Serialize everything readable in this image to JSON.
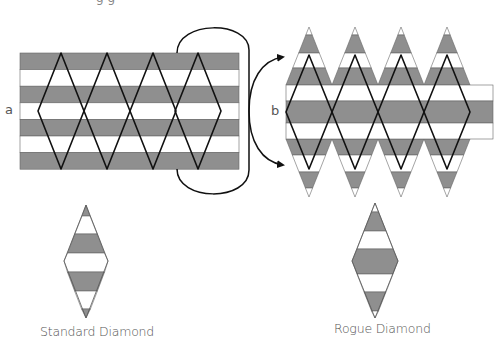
{
  "figure": {
    "top_clipped_text": "g g",
    "panel_a": {
      "label": "a"
    },
    "panel_b": {
      "label": "b"
    },
    "captions": {
      "standard": "Standard Diamond",
      "rogue": "Rogue Diamond"
    },
    "colors": {
      "stripe_gray": "#8f8f8f",
      "stripe_white": "#ffffff",
      "outline": "#111111",
      "stripe_border": "#666666",
      "label_text": "#555555"
    },
    "diamond_count": 4
  }
}
